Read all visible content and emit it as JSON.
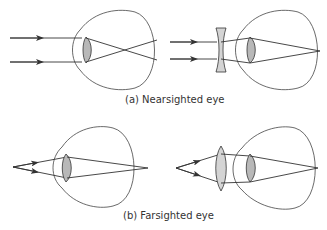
{
  "panels": [
    {
      "id": "a",
      "caption": "(a) Nearsighted eye",
      "left": {
        "description": "Parallel rays focus in front of retina",
        "corrective_lens": null
      },
      "right": {
        "description": "Diverging (concave) corrective lens moves focus onto retina",
        "corrective_lens": "concave"
      }
    },
    {
      "id": "b",
      "caption": "(b) Farsighted eye",
      "left": {
        "description": "Rays from near point focus behind retina",
        "corrective_lens": null
      },
      "right": {
        "description": "Converging (convex) corrective lens moves focus onto retina",
        "corrective_lens": "convex"
      }
    }
  ],
  "colors": {
    "line": "#333333",
    "eye_lens_fill": "#b8b8b8",
    "corrective_lens_fill": "#d4d4d4",
    "background": "#ffffff"
  }
}
